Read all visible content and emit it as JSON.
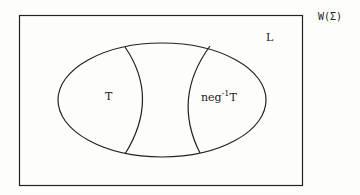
{
  "diagram": {
    "universe_label": "W(Σ)",
    "set_L_label": "L",
    "region_T_label": "T",
    "region_negT_base": "neg",
    "region_negT_sup": "-1",
    "region_negT_tail": "T",
    "colors": {
      "stroke": "#222222",
      "background": "#fdfdfb"
    }
  }
}
